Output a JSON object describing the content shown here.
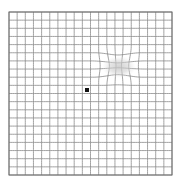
{
  "chart_data": {
    "type": "line",
    "subtitle": "",
    "xlabel": "",
    "ylabel": "",
    "grid": true,
    "legend_position": "none",
    "categories": [],
    "values": [],
    "axis_ranges": {
      "x": [
        0,
        20
      ],
      "y": [
        0,
        20
      ]
    },
    "grid_spec": {
      "columns": 20,
      "rows": 20,
      "cell_size_px": 8.15,
      "origin_px": [
        9,
        12
      ],
      "extent_px": [
        172,
        175
      ],
      "line_color": "#8a8a8a",
      "line_width_px": 0.8,
      "border_color": "#6e6e6e",
      "border_width_px": 1.0,
      "background_color": "#ffffff"
    },
    "fixation_point": {
      "label": "central fixation dot",
      "center_px": [
        87,
        90
      ],
      "size_px": 4,
      "color": "#111111",
      "shape": "square"
    },
    "distortion_region": {
      "label": "metamorphopsia / scotoma",
      "center_px": [
        118,
        66
      ],
      "bounds_px": [
        92,
        42,
        148,
        88
      ],
      "blob_center_px": [
        119,
        67
      ],
      "blob_radius_px": [
        17,
        11
      ],
      "blob_color": "#cfcfcf",
      "blob_opacity": 0.55,
      "warp_strength": 0.42,
      "description": "Grid lines bow and pinch toward a soft grey blur in the upper-right quadrant"
    },
    "annotations": []
  }
}
